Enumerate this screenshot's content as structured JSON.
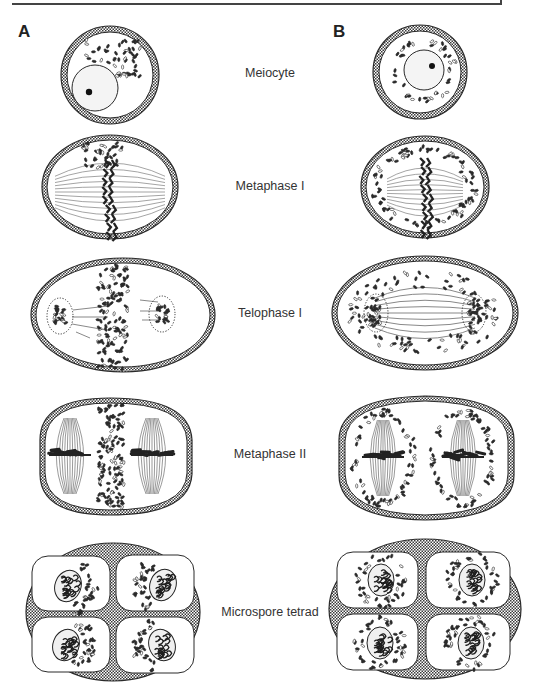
{
  "figure": {
    "type": "comparative schematic of meiosis / microsporogenesis",
    "panel_labels": [
      "A",
      "B"
    ],
    "stages": [
      {
        "id": "meiocyte",
        "label": "Meiocyte",
        "y": 75
      },
      {
        "id": "metaphase-1",
        "label": "Metaphase I",
        "y": 188
      },
      {
        "id": "telophase-1",
        "label": "Telophase I",
        "y": 315
      },
      {
        "id": "metaphase-2",
        "label": "Metaphase II",
        "y": 456
      },
      {
        "id": "microspore-tetrad",
        "label": "Microspore tetrad",
        "y": 614
      }
    ],
    "colors": {
      "ink": "#2a2a2a",
      "wall_pattern": "#3a3a3a",
      "nucleus_fill": "#f4f4f4",
      "spindle": "#555555",
      "background": "#ffffff"
    },
    "panel_A_description": "Organelles aggregated on one side / in the equatorial plane (polarized distribution)",
    "panel_B_description": "Organelles distributed evenly around nucleus/spindle (perinuclear ring)"
  }
}
